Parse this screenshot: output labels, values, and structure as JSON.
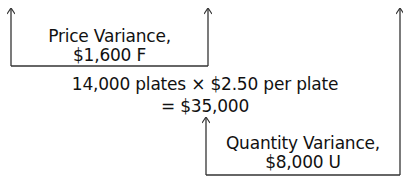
{
  "diagram": {
    "price_variance": {
      "title": "Price Variance,",
      "amount": "$1,600 F"
    },
    "center": {
      "formula": "14,000 plates × $2.50 per plate",
      "result": "= $35,000"
    },
    "quantity_variance": {
      "title": "Quantity Variance,",
      "amount": "$8,000 U"
    },
    "colors": {
      "line": "#333333",
      "text": "#111111"
    }
  }
}
